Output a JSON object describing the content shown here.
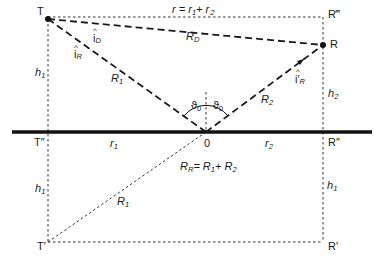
{
  "diagram": {
    "points": {
      "T": "T",
      "R": "R",
      "R_top": "R‴",
      "T_ground": "T″",
      "R_ground": "R″",
      "T_image": "T′",
      "R_image": "R′",
      "O": "0"
    },
    "labels": {
      "r_total": "r = r",
      "r_total_1": "1",
      "r_total_plus": "+ r",
      "r_total_2": "2",
      "R_D": "R",
      "R_D_sub": "D",
      "i_D": "i",
      "i_D_sub": "D",
      "i_R": "i",
      "i_R_sub": "R",
      "i_R_prime": "i′",
      "i_R_prime_sub": "R",
      "R1_upper": "R",
      "R1_upper_sub": "1",
      "R2": "R",
      "R2_sub": "2",
      "theta_left": "ϑ",
      "theta_left_sub": "0",
      "theta_right": "ϑ",
      "theta_right_sub": "0",
      "h1_upper": "h",
      "h1_upper_sub": "1",
      "h2": "h",
      "h2_sub": "2",
      "r1": "r",
      "r1_sub": "1",
      "r2": "r",
      "r2_sub": "2",
      "h1_lower_left": "h",
      "h1_lower_left_sub": "1",
      "h1_lower_right": "h",
      "h1_lower_right_sub": "1",
      "R1_lower": "R",
      "R1_lower_sub": "1",
      "RR_eq_R": "R",
      "RR_eq_R_sub": "R",
      "RR_eq_rest": "= R",
      "RR_eq_1": "1",
      "RR_eq_plus": "+ R",
      "RR_eq_2": "2",
      "hat": "^"
    }
  }
}
